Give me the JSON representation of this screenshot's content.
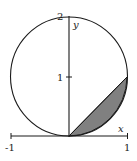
{
  "diagram": {
    "axes": {
      "x_label": "x",
      "y_label": "y",
      "x_ticks": [
        "-1",
        "1"
      ],
      "y_ticks": [
        "1",
        "2"
      ]
    },
    "circle": {
      "center": [
        0,
        1
      ],
      "radius": 1
    },
    "line": "y = x",
    "shaded_region": {
      "from": [
        0,
        0
      ],
      "to": [
        1,
        1
      ],
      "fill": "#808080"
    },
    "colors": {
      "stroke": "#1a1a1a",
      "shade": "#808080",
      "background": "#ffffff"
    }
  }
}
